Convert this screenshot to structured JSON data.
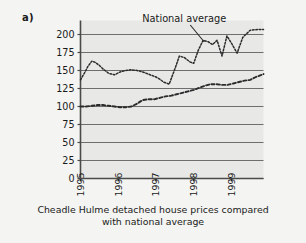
{
  "panel": {
    "label": "a)"
  },
  "caption": {
    "line1": "Cheadle Hulme detached house prices compared",
    "line2": "with national average"
  },
  "colors": {
    "plot_background": "#e8e8e6",
    "page_background": "#f4f4f2",
    "gridline": "#6e6e6e",
    "axis": "#4a4a4a",
    "series": "#2b2b2b",
    "text": "#1a1a1a"
  },
  "chart_data": {
    "type": "line",
    "title": "Cheadle Hulme detached house prices compared with national average",
    "xlabel": "",
    "ylabel": "",
    "ylim": [
      0,
      212
    ],
    "yticks": [
      0,
      25,
      50,
      75,
      100,
      125,
      150,
      175,
      200
    ],
    "ytick_labels": [
      "0",
      "25",
      "50",
      "75",
      "100",
      "125",
      "150",
      "175",
      "200"
    ],
    "xticks": [
      1995,
      1996,
      1997,
      1998,
      1999
    ],
    "xtick_labels": [
      "1995",
      "1996",
      "1997",
      "1998",
      "1999"
    ],
    "xlim": [
      1995,
      1999.85
    ],
    "grid": "horizontal",
    "legend_position": "inline-annotation",
    "annotations": [
      {
        "text": "National average",
        "x": 1997.75,
        "y": 207,
        "points_to_series": "National average"
      }
    ],
    "series": [
      {
        "name": "National average",
        "style": "dotted",
        "x": [
          1995.0,
          1995.1,
          1995.2,
          1995.3,
          1995.4,
          1995.5,
          1995.6,
          1995.75,
          1995.9,
          1996.05,
          1996.2,
          1996.35,
          1996.5,
          1996.65,
          1996.8,
          1996.9,
          1997.0,
          1997.1,
          1997.2,
          1997.35,
          1997.5,
          1997.62,
          1997.75,
          1997.9,
          1998.0,
          1998.12,
          1998.25,
          1998.38,
          1998.5,
          1998.62,
          1998.75,
          1998.88,
          1999.0,
          1999.15,
          1999.3,
          1999.5,
          1999.7,
          1999.85
        ],
        "y": [
          137,
          146,
          156,
          163,
          161,
          157,
          152,
          146,
          144,
          148,
          150,
          151,
          150,
          148,
          145,
          143,
          141,
          138,
          134,
          131,
          152,
          170,
          168,
          162,
          160,
          178,
          192,
          190,
          186,
          192,
          170,
          198,
          188,
          174,
          196,
          206,
          207,
          207
        ]
      },
      {
        "name": "Cheadle Hulme detached house prices",
        "style": "dashed",
        "x": [
          1995.0,
          1995.15,
          1995.3,
          1995.45,
          1995.6,
          1995.75,
          1995.9,
          1996.05,
          1996.2,
          1996.35,
          1996.5,
          1996.65,
          1996.8,
          1996.95,
          1997.1,
          1997.25,
          1997.4,
          1997.55,
          1997.7,
          1997.85,
          1998.0,
          1998.15,
          1998.3,
          1998.45,
          1998.6,
          1998.75,
          1998.9,
          1999.05,
          1999.2,
          1999.35,
          1999.5,
          1999.65,
          1999.85
        ],
        "y": [
          100,
          100,
          101,
          102,
          102,
          101,
          100,
          99,
          99,
          100,
          104,
          109,
          110,
          110,
          112,
          114,
          115,
          117,
          119,
          121,
          123,
          126,
          129,
          131,
          131,
          130,
          130,
          132,
          134,
          136,
          137,
          141,
          145
        ]
      }
    ]
  }
}
